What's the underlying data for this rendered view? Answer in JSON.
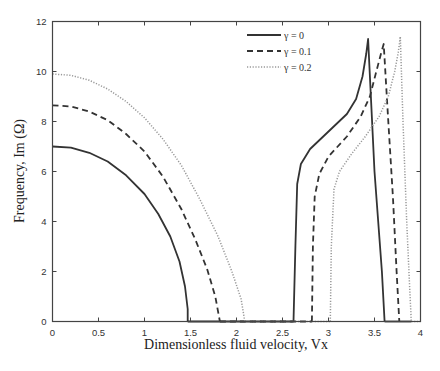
{
  "chart_data": {
    "type": "line",
    "title": "",
    "xlabel": "Dimensionless fluid velocity, Vx",
    "ylabel": "Frequency, Im (Ω)",
    "xlim": [
      0,
      4
    ],
    "ylim": [
      0,
      12
    ],
    "xticks": [
      0,
      0.5,
      1,
      1.5,
      2,
      2.5,
      3,
      3.5,
      4
    ],
    "xtick_labels": [
      "0",
      "0.5",
      "1",
      "1.5",
      "2",
      "2.5",
      "3",
      "3.5",
      "4"
    ],
    "yticks": [
      0,
      2,
      4,
      6,
      8,
      10,
      12
    ],
    "ytick_labels": [
      "0",
      "2",
      "4",
      "6",
      "8",
      "10",
      "12"
    ],
    "grid": false,
    "legend_position": "upper-center-right",
    "series": [
      {
        "name": "γ = 0",
        "style": "solid",
        "color": "#333333",
        "width": 1.8,
        "segments": [
          [
            [
              0,
              7.0
            ],
            [
              0.2,
              6.95
            ],
            [
              0.4,
              6.75
            ],
            [
              0.6,
              6.4
            ],
            [
              0.8,
              5.85
            ],
            [
              1.0,
              5.1
            ],
            [
              1.15,
              4.3
            ],
            [
              1.28,
              3.4
            ],
            [
              1.38,
              2.4
            ],
            [
              1.44,
              1.4
            ],
            [
              1.47,
              0.5
            ],
            [
              1.47,
              0
            ]
          ],
          [
            [
              1.47,
              0
            ],
            [
              2.62,
              0
            ]
          ],
          [
            [
              2.62,
              0
            ],
            [
              2.64,
              3.0
            ],
            [
              2.66,
              5.5
            ],
            [
              2.7,
              6.3
            ],
            [
              2.8,
              6.9
            ],
            [
              3.0,
              7.6
            ],
            [
              3.2,
              8.3
            ],
            [
              3.3,
              8.9
            ],
            [
              3.37,
              9.8
            ],
            [
              3.41,
              10.7
            ],
            [
              3.43,
              11.3
            ],
            [
              3.5,
              6.0
            ],
            [
              3.58,
              2.0
            ],
            [
              3.61,
              0
            ]
          ],
          [
            [
              3.61,
              0
            ],
            [
              3.9,
              0
            ]
          ]
        ]
      },
      {
        "name": "γ = 0.1",
        "style": "dashed",
        "color": "#333333",
        "width": 1.8,
        "segments": [
          [
            [
              0,
              8.65
            ],
            [
              0.2,
              8.6
            ],
            [
              0.4,
              8.4
            ],
            [
              0.6,
              8.05
            ],
            [
              0.8,
              7.5
            ],
            [
              1.0,
              6.8
            ],
            [
              1.2,
              5.8
            ],
            [
              1.4,
              4.5
            ],
            [
              1.55,
              3.3
            ],
            [
              1.68,
              2.1
            ],
            [
              1.77,
              1.0
            ],
            [
              1.82,
              0
            ]
          ],
          [
            [
              1.82,
              0
            ],
            [
              2.82,
              0
            ]
          ],
          [
            [
              2.82,
              0
            ],
            [
              2.83,
              3.0
            ],
            [
              2.85,
              5.0
            ],
            [
              2.9,
              5.9
            ],
            [
              3.0,
              6.6
            ],
            [
              3.2,
              7.4
            ],
            [
              3.35,
              8.2
            ],
            [
              3.45,
              9.0
            ],
            [
              3.52,
              10.0
            ],
            [
              3.57,
              10.7
            ],
            [
              3.6,
              11.1
            ],
            [
              3.65,
              8.0
            ],
            [
              3.7,
              5.0
            ],
            [
              3.74,
              2.0
            ],
            [
              3.77,
              0
            ]
          ]
        ]
      },
      {
        "name": "γ = 0.2",
        "style": "dotted",
        "color": "#999999",
        "width": 1.5,
        "segments": [
          [
            [
              0,
              9.9
            ],
            [
              0.2,
              9.85
            ],
            [
              0.4,
              9.65
            ],
            [
              0.6,
              9.3
            ],
            [
              0.8,
              8.8
            ],
            [
              1.0,
              8.15
            ],
            [
              1.2,
              7.3
            ],
            [
              1.4,
              6.25
            ],
            [
              1.6,
              4.9
            ],
            [
              1.8,
              3.4
            ],
            [
              1.95,
              2.0
            ],
            [
              2.05,
              0.9
            ],
            [
              2.09,
              0
            ]
          ],
          [
            [
              2.09,
              0
            ],
            [
              3.02,
              0
            ]
          ],
          [
            [
              3.02,
              0
            ],
            [
              3.03,
              3.0
            ],
            [
              3.06,
              5.3
            ],
            [
              3.12,
              6.0
            ],
            [
              3.25,
              6.7
            ],
            [
              3.4,
              7.4
            ],
            [
              3.55,
              8.2
            ],
            [
              3.65,
              9.0
            ],
            [
              3.72,
              10.0
            ],
            [
              3.76,
              10.8
            ],
            [
              3.78,
              11.4
            ],
            [
              3.81,
              8.0
            ],
            [
              3.85,
              4.0
            ],
            [
              3.88,
              1.5
            ],
            [
              3.9,
              0
            ]
          ],
          [
            [
              3.9,
              0
            ],
            [
              4.0,
              0
            ]
          ]
        ]
      }
    ]
  },
  "legend": {
    "items": [
      {
        "label": "γ = 0",
        "style": "solid"
      },
      {
        "label": "γ = 0.1",
        "style": "dashed"
      },
      {
        "label": "γ = 0.2",
        "style": "dotted"
      }
    ]
  },
  "axes": {
    "xlabel": "Dimensionless fluid velocity, Vx",
    "ylabel": "Frequency, Im (Ω)"
  }
}
